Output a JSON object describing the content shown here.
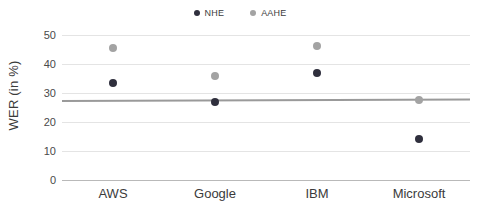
{
  "chart_data": {
    "type": "scatter",
    "title": "",
    "xlabel": "",
    "ylabel": "WER (in %)",
    "categories": [
      "AWS",
      "Google",
      "IBM",
      "Microsoft"
    ],
    "ylim": [
      0,
      50
    ],
    "yticks": [
      0,
      10,
      20,
      30,
      40,
      50
    ],
    "grid": true,
    "legend_position": "top-center",
    "series": [
      {
        "name": "NHE",
        "color": "#2f2f3d",
        "values": [
          33.5,
          27.0,
          36.8,
          14.2
        ]
      },
      {
        "name": "AAHE",
        "color": "#a3a3a3",
        "values": [
          45.5,
          36.0,
          46.3,
          27.5
        ]
      }
    ],
    "trendline": {
      "name": "trendline",
      "color": "#9a9a9a",
      "start_value": 27.2,
      "end_value": 27.8
    }
  },
  "axes": {
    "y_title": "WER (in %)",
    "y_tick_labels": [
      "50",
      "40",
      "30",
      "20",
      "10",
      "0"
    ],
    "x_tick_labels": [
      "AWS",
      "Google",
      "IBM",
      "Microsoft"
    ]
  },
  "legend": {
    "items": [
      {
        "label": "NHE",
        "color": "#2f2f3d"
      },
      {
        "label": "AAHE",
        "color": "#a3a3a3"
      }
    ]
  },
  "colors": {
    "nhe": "#2f2f3d",
    "aahe": "#a3a3a3",
    "gridline": "#e4e4e4",
    "baseline": "#b9b9b9",
    "trendline": "#9a9a9a",
    "text": "#3b3b3b",
    "background": "#ffffff"
  }
}
